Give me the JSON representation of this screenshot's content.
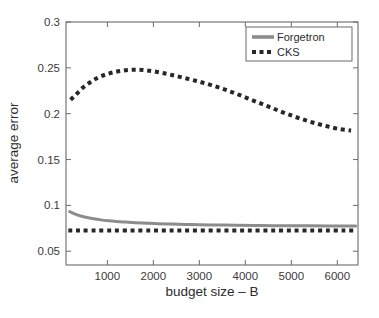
{
  "chart_data": {
    "type": "line",
    "title": "",
    "xlabel": "budget size – B",
    "ylabel": "average error",
    "xlim": [
      100,
      6450
    ],
    "ylim": [
      0.035,
      0.3
    ],
    "xticks": [
      1000,
      2000,
      3000,
      4000,
      5000,
      6000
    ],
    "xtick_labels": [
      "1000",
      "2000",
      "3000",
      "4000",
      "5000",
      "6000"
    ],
    "yticks": [
      0.05,
      0.1,
      0.15,
      0.2,
      0.25,
      0.3
    ],
    "ytick_labels": [
      "0.05",
      "0.1",
      "0.15",
      "0.2",
      "0.25",
      "0.3"
    ],
    "grid": false,
    "legend_position": "top-right",
    "series": [
      {
        "name": "Forgetron",
        "style": "solid",
        "color": "#8c8c8c",
        "linewidth": 3,
        "x": [
          180,
          300,
          420,
          560,
          700,
          860,
          1020,
          1200,
          1400,
          1600,
          1850,
          2100,
          2400,
          2700,
          3000,
          3400,
          3800,
          4200,
          4600,
          5000,
          5400,
          5800,
          6200,
          6400
        ],
        "values": [
          0.0932,
          0.0905,
          0.0885,
          0.0868,
          0.0854,
          0.0842,
          0.0833,
          0.0825,
          0.0818,
          0.0812,
          0.0806,
          0.0801,
          0.0796,
          0.0792,
          0.0789,
          0.0786,
          0.0783,
          0.0781,
          0.0779,
          0.0778,
          0.0777,
          0.0776,
          0.0775,
          0.0775
        ]
      },
      {
        "name": "CKS",
        "style": "dotted",
        "color": "#272727",
        "linewidth": 4,
        "x": [
          200,
          330,
          470,
          620,
          780,
          950,
          1120,
          1300,
          1480,
          1650,
          1820,
          2000,
          2200,
          2400,
          2620,
          2850,
          3080,
          3320,
          3560,
          3800,
          4050,
          4300,
          4550,
          4800,
          5050,
          5300,
          5550,
          5800,
          6050,
          6300
        ],
        "values": [
          0.2152,
          0.2215,
          0.2285,
          0.234,
          0.239,
          0.2425,
          0.245,
          0.2468,
          0.2478,
          0.248,
          0.2474,
          0.2462,
          0.2444,
          0.2422,
          0.2396,
          0.2368,
          0.2338,
          0.2302,
          0.2262,
          0.2218,
          0.2168,
          0.2118,
          0.2068,
          0.2018,
          0.1972,
          0.193,
          0.1892,
          0.186,
          0.1832,
          0.1818
        ]
      },
      {
        "name": "CKS baseline",
        "style": "dotted",
        "color": "#272727",
        "linewidth": 4,
        "x": [
          150,
          6400
        ],
        "values": [
          0.0725,
          0.0725
        ]
      }
    ],
    "legend_entries": [
      {
        "label": "Forgetron",
        "style": "solid",
        "color": "#8c8c8c"
      },
      {
        "label": "CKS",
        "style": "dotted",
        "color": "#272727"
      }
    ]
  },
  "axes": {
    "frame_color": "#6b6b6b",
    "background": "#ffffff"
  }
}
